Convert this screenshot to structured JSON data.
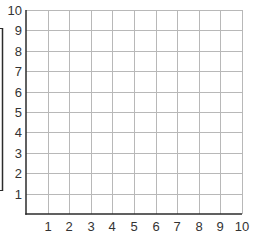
{
  "chart_data": {
    "type": "line",
    "title": "",
    "xlabel": "",
    "ylabel": "",
    "x_ticks": [
      "1",
      "2",
      "3",
      "4",
      "5",
      "6",
      "7",
      "8",
      "9",
      "10"
    ],
    "y_ticks": [
      "1",
      "2",
      "3",
      "4",
      "5",
      "6",
      "7",
      "8",
      "9",
      "10"
    ],
    "xlim": [
      0,
      10
    ],
    "ylim": [
      0,
      10
    ],
    "grid": true,
    "series": [],
    "legend": null,
    "annotations": [
      "left bracket spanning y-axis labels 1-9"
    ]
  },
  "colors": {
    "axis": "#2b2b2b",
    "grid": "#b8b8b8",
    "text": "#333333",
    "background": "#ffffff"
  }
}
